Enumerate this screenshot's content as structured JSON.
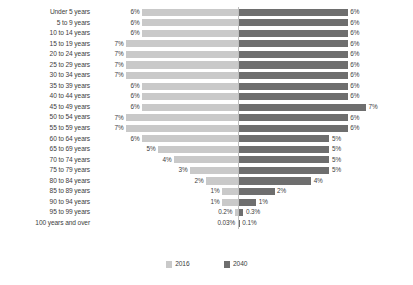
{
  "chart_data": {
    "type": "bar",
    "subtype": "diverging-population-pyramid",
    "title": "",
    "xlabel": "",
    "ylabel": "",
    "orientation": "horizontal",
    "grid": false,
    "legend_position": "bottom-center",
    "axis_center_label": "",
    "categories": [
      "Under 5 years",
      "5 to 9 years",
      "10 to 14 years",
      "15 to 19 years",
      "20 to 24 years",
      "25 to 29 years",
      "30 to 34 years",
      "35 to 39 years",
      "40 to 44 years",
      "45 to 49 years",
      "50 to 54 years",
      "55 to 59 years",
      "60 to 64 years",
      "65 to 69 years",
      "70 to 74 years",
      "75 to 79 years",
      "80 to 84 years",
      "85 to 89 years",
      "90 to 94 years",
      "95 to 99 years",
      "100 years and over"
    ],
    "series": [
      {
        "name": "2016",
        "side": "left",
        "color": "#c9c9c9",
        "values": [
          6,
          6,
          6,
          7,
          7,
          7,
          7,
          6,
          6,
          6,
          7,
          7,
          6,
          5,
          4,
          3,
          2,
          1,
          1,
          0.2,
          0.03
        ],
        "labels": [
          "6%",
          "6%",
          "6%",
          "7%",
          "7%",
          "7%",
          "7%",
          "6%",
          "6%",
          "6%",
          "7%",
          "7%",
          "6%",
          "5%",
          "4%",
          "3%",
          "2%",
          "1%",
          "1%",
          "0.2%",
          "0.03%"
        ]
      },
      {
        "name": "2040",
        "side": "right",
        "color": "#6e6e6e",
        "values": [
          6,
          6,
          6,
          6,
          6,
          6,
          6,
          6,
          6,
          7,
          6,
          6,
          5,
          5,
          5,
          5,
          4,
          2,
          1,
          0.3,
          0.1
        ],
        "labels": [
          "6%",
          "6%",
          "6%",
          "6%",
          "6%",
          "6%",
          "6%",
          "6%",
          "6%",
          "7%",
          "6%",
          "6%",
          "5%",
          "5%",
          "5%",
          "5%",
          "4%",
          "2%",
          "1%",
          "0.3%",
          "0.1%"
        ]
      }
    ],
    "xlim_left": [
      0,
      7.6
    ],
    "xlim_right": [
      0,
      7.6
    ]
  },
  "legend": {
    "entries": [
      {
        "label": "2016",
        "color": "#c9c9c9"
      },
      {
        "label": "2040",
        "color": "#6e6e6e"
      }
    ]
  },
  "colors": {
    "series_2016": "#c9c9c9",
    "series_2040": "#6e6e6e",
    "text": "#3d3d3d",
    "axis": "#bfbfbf",
    "background": "#ffffff"
  }
}
